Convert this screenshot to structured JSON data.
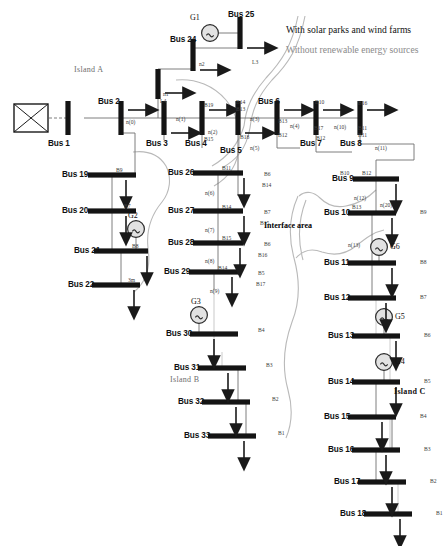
{
  "figure": {
    "type": "single-line-diagram",
    "legend": {
      "with_renewables": "With solar parks and wind farms",
      "without_renewables": "Without renewable energy sources",
      "with_color": "#111111",
      "without_color": "#8a8a8a"
    },
    "annotations": {
      "island_a": "Island A",
      "island_b": "Island B",
      "island_c": "Island C",
      "interface_area": "Interface area"
    },
    "source": {
      "name": "grid-source",
      "symbol": "crossed-box"
    }
  },
  "buses": [
    {
      "id": "bus1",
      "label": "Bus 1",
      "x": 68,
      "y": 118,
      "orient": "v",
      "len": 34,
      "name_x": 48,
      "name_y": 140
    },
    {
      "id": "bus2",
      "label": "Bus 2",
      "x": 121,
      "y": 118,
      "orient": "v",
      "len": 34,
      "name_x": 98,
      "name_y": 98
    },
    {
      "id": "bus3",
      "label": "Bus 3",
      "x": 164,
      "y": 118,
      "orient": "v",
      "len": 34,
      "name_x": 146,
      "name_y": 140
    },
    {
      "id": "bus4",
      "label": "Bus 4",
      "x": 202,
      "y": 118,
      "orient": "v",
      "len": 34,
      "name_x": 185,
      "name_y": 140
    },
    {
      "id": "bus5",
      "label": "Bus 5",
      "x": 238,
      "y": 118,
      "orient": "v",
      "len": 34,
      "name_x": 220,
      "name_y": 147
    },
    {
      "id": "bus6",
      "label": "Bus 6",
      "x": 277,
      "y": 118,
      "orient": "v",
      "len": 34,
      "name_x": 258,
      "name_y": 98
    },
    {
      "id": "bus7",
      "label": "Bus 7",
      "x": 316,
      "y": 118,
      "orient": "v",
      "len": 34,
      "name_x": 300,
      "name_y": 140
    },
    {
      "id": "bus8",
      "label": "Bus 8",
      "x": 360,
      "y": 118,
      "orient": "v",
      "len": 34,
      "name_x": 340,
      "name_y": 140
    },
    {
      "id": "bus24",
      "label": "Bus 24",
      "x": 193,
      "y": 55,
      "orient": "v",
      "len": 32,
      "name_x": 170,
      "name_y": 36
    },
    {
      "id": "bus25",
      "label": "Bus 25",
      "x": 240,
      "y": 33,
      "orient": "v",
      "len": 32,
      "name_x": 228,
      "name_y": 11
    },
    {
      "id": "bus23",
      "label": "",
      "x": 158,
      "y": 84,
      "orient": "v",
      "len": 30,
      "name_x": 0,
      "name_y": 0
    },
    {
      "id": "bus19",
      "label": "Bus 19",
      "x": 112,
      "y": 175,
      "orient": "h",
      "len": 48,
      "name_x": 62,
      "name_y": 171
    },
    {
      "id": "bus20",
      "label": "Bus 20",
      "x": 112,
      "y": 211,
      "orient": "h",
      "len": 48,
      "name_x": 62,
      "name_y": 207
    },
    {
      "id": "bus21",
      "label": "Bus 21",
      "x": 121,
      "y": 251,
      "orient": "h",
      "len": 54,
      "name_x": 74,
      "name_y": 247
    },
    {
      "id": "bus22",
      "label": "Bus 22",
      "x": 116,
      "y": 285,
      "orient": "h",
      "len": 48,
      "name_x": 68,
      "name_y": 281
    },
    {
      "id": "bus26",
      "label": "Bus 26",
      "x": 218,
      "y": 173,
      "orient": "h",
      "len": 50,
      "name_x": 168,
      "name_y": 169
    },
    {
      "id": "bus27",
      "label": "Bus 27",
      "x": 218,
      "y": 211,
      "orient": "h",
      "len": 50,
      "name_x": 168,
      "name_y": 207
    },
    {
      "id": "bus28",
      "label": "Bus 28",
      "x": 218,
      "y": 243,
      "orient": "h",
      "len": 50,
      "name_x": 168,
      "name_y": 239
    },
    {
      "id": "bus29",
      "label": "Bus 29",
      "x": 214,
      "y": 272,
      "orient": "h",
      "len": 50,
      "name_x": 164,
      "name_y": 268
    },
    {
      "id": "bus30",
      "label": "Bus 30",
      "x": 214,
      "y": 334,
      "orient": "h",
      "len": 48,
      "name_x": 166,
      "name_y": 330
    },
    {
      "id": "bus31",
      "label": "Bus 31",
      "x": 222,
      "y": 368,
      "orient": "h",
      "len": 48,
      "name_x": 174,
      "name_y": 364
    },
    {
      "id": "bus32",
      "label": "Bus 32",
      "x": 226,
      "y": 402,
      "orient": "h",
      "len": 48,
      "name_x": 178,
      "name_y": 398
    },
    {
      "id": "bus33",
      "label": "Bus 33",
      "x": 232,
      "y": 436,
      "orient": "h",
      "len": 48,
      "name_x": 184,
      "name_y": 432
    },
    {
      "id": "bus9",
      "label": "Bus 9",
      "x": 376,
      "y": 179,
      "orient": "h",
      "len": 46,
      "name_x": 332,
      "name_y": 175
    },
    {
      "id": "bus10",
      "label": "Bus 10",
      "x": 372,
      "y": 213,
      "orient": "h",
      "len": 48,
      "name_x": 324,
      "name_y": 209
    },
    {
      "id": "bus11",
      "label": "Bus 11",
      "x": 372,
      "y": 263,
      "orient": "h",
      "len": 48,
      "name_x": 324,
      "name_y": 259
    },
    {
      "id": "bus12",
      "label": "Bus 12",
      "x": 372,
      "y": 298,
      "orient": "h",
      "len": 48,
      "name_x": 324,
      "name_y": 294
    },
    {
      "id": "bus13",
      "label": "Bus 13",
      "x": 376,
      "y": 336,
      "orient": "h",
      "len": 48,
      "name_x": 328,
      "name_y": 332
    },
    {
      "id": "bus14",
      "label": "Bus 14",
      "x": 376,
      "y": 382,
      "orient": "h",
      "len": 48,
      "name_x": 328,
      "name_y": 378
    },
    {
      "id": "bus15",
      "label": "Bus 15",
      "x": 372,
      "y": 417,
      "orient": "h",
      "len": 48,
      "name_x": 324,
      "name_y": 413
    },
    {
      "id": "bus16",
      "label": "Bus 16",
      "x": 376,
      "y": 450,
      "orient": "h",
      "len": 48,
      "name_x": 328,
      "name_y": 446
    },
    {
      "id": "bus17",
      "label": "Bus 17",
      "x": 382,
      "y": 482,
      "orient": "h",
      "len": 48,
      "name_x": 334,
      "name_y": 478
    },
    {
      "id": "bus18",
      "label": "Bus 18",
      "x": 388,
      "y": 514,
      "orient": "h",
      "len": 48,
      "name_x": 340,
      "name_y": 510
    }
  ],
  "generators": [
    {
      "id": "g1",
      "label": "G1",
      "cx": 210,
      "cy": 33,
      "lx": 190,
      "ly": 14
    },
    {
      "id": "g2",
      "label": "G2",
      "cx": 136,
      "cy": 229,
      "lx": 128,
      "ly": 212
    },
    {
      "id": "g3",
      "label": "G3",
      "cx": 199,
      "cy": 315,
      "lx": 191,
      "ly": 298
    },
    {
      "id": "g6",
      "label": "G6",
      "cx": 379,
      "cy": 247,
      "lx": 390,
      "ly": 243
    },
    {
      "id": "g5",
      "label": "G5",
      "cx": 384,
      "cy": 317,
      "lx": 395,
      "ly": 313
    },
    {
      "id": "g4",
      "label": "G4",
      "cx": 384,
      "cy": 362,
      "lx": 395,
      "ly": 358
    }
  ],
  "branch_labels": [
    {
      "text": "n(0)",
      "x": 126,
      "y": 120
    },
    {
      "text": "n(1)",
      "x": 176,
      "y": 117
    },
    {
      "text": "n(2)",
      "x": 208,
      "y": 130
    },
    {
      "text": "n(3)",
      "x": 250,
      "y": 117
    },
    {
      "text": "n(4)",
      "x": 290,
      "y": 124
    },
    {
      "text": "n(5)",
      "x": 250,
      "y": 146
    },
    {
      "text": "n(6)",
      "x": 205,
      "y": 191
    },
    {
      "text": "n(7)",
      "x": 205,
      "y": 228
    },
    {
      "text": "n(8)",
      "x": 205,
      "y": 259
    },
    {
      "text": "n(9)",
      "x": 210,
      "y": 289
    },
    {
      "text": "n(10)",
      "x": 334,
      "y": 125
    },
    {
      "text": "n(11)",
      "x": 375,
      "y": 146
    },
    {
      "text": "n(12)",
      "x": 354,
      "y": 196
    },
    {
      "text": "n(13)",
      "x": 348,
      "y": 243
    },
    {
      "text": "n(20)",
      "x": 380,
      "y": 203
    },
    {
      "text": "L4",
      "x": 160,
      "y": 99
    },
    {
      "text": "L3",
      "x": 252,
      "y": 60
    },
    {
      "text": "n2",
      "x": 199,
      "y": 62
    },
    {
      "text": "n1",
      "x": 163,
      "y": 92
    },
    {
      "text": "B19",
      "x": 204,
      "y": 103
    },
    {
      "text": "B15",
      "x": 204,
      "y": 137
    },
    {
      "text": "B14",
      "x": 236,
      "y": 100
    },
    {
      "text": "B13",
      "x": 236,
      "y": 107
    },
    {
      "text": "B18",
      "x": 240,
      "y": 135
    },
    {
      "text": "B13",
      "x": 278,
      "y": 119
    },
    {
      "text": "B12",
      "x": 278,
      "y": 133
    },
    {
      "text": "B12",
      "x": 316,
      "y": 136
    },
    {
      "text": "B10",
      "x": 315,
      "y": 100
    },
    {
      "text": "B17",
      "x": 314,
      "y": 126
    },
    {
      "text": "B16",
      "x": 358,
      "y": 101
    },
    {
      "text": "B11",
      "x": 358,
      "y": 126
    },
    {
      "text": "B11",
      "x": 358,
      "y": 133
    },
    {
      "text": "B9",
      "x": 116,
      "y": 168
    },
    {
      "text": "B7",
      "x": 124,
      "y": 204
    },
    {
      "text": "B8",
      "x": 132,
      "y": 244
    },
    {
      "text": "3m",
      "x": 128,
      "y": 278
    },
    {
      "text": "B11",
      "x": 222,
      "y": 166
    },
    {
      "text": "B6",
      "x": 264,
      "y": 172
    },
    {
      "text": "B14",
      "x": 262,
      "y": 183
    },
    {
      "text": "B14",
      "x": 222,
      "y": 205
    },
    {
      "text": "B7",
      "x": 264,
      "y": 210
    },
    {
      "text": "B15",
      "x": 260,
      "y": 221
    },
    {
      "text": "B15",
      "x": 222,
      "y": 236
    },
    {
      "text": "B6",
      "x": 264,
      "y": 242
    },
    {
      "text": "B16",
      "x": 258,
      "y": 253
    },
    {
      "text": "B14",
      "x": 218,
      "y": 266
    },
    {
      "text": "B5",
      "x": 258,
      "y": 271
    },
    {
      "text": "B17",
      "x": 256,
      "y": 282
    },
    {
      "text": "B4",
      "x": 258,
      "y": 328
    },
    {
      "text": "B3",
      "x": 266,
      "y": 363
    },
    {
      "text": "B2",
      "x": 272,
      "y": 397
    },
    {
      "text": "B1",
      "x": 278,
      "y": 431
    },
    {
      "text": "B10",
      "x": 340,
      "y": 171
    },
    {
      "text": "B12",
      "x": 362,
      "y": 171
    },
    {
      "text": "B13",
      "x": 352,
      "y": 205
    },
    {
      "text": "B9",
      "x": 420,
      "y": 210
    },
    {
      "text": "B8",
      "x": 420,
      "y": 260
    },
    {
      "text": "B7",
      "x": 420,
      "y": 295
    },
    {
      "text": "B6",
      "x": 424,
      "y": 333
    },
    {
      "text": "B5",
      "x": 424,
      "y": 379
    },
    {
      "text": "B4",
      "x": 420,
      "y": 414
    },
    {
      "text": "B3",
      "x": 424,
      "y": 447
    },
    {
      "text": "B2",
      "x": 430,
      "y": 479
    },
    {
      "text": "B1",
      "x": 436,
      "y": 511
    }
  ]
}
